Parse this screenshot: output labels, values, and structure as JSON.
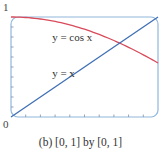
{
  "chart_data": {
    "type": "line",
    "title": "",
    "caption": "(b) [0, 1] by [0, 1]",
    "xlabel": "",
    "ylabel": "",
    "xlim": [
      0,
      1
    ],
    "ylim": [
      0,
      1
    ],
    "grid": false,
    "tick_labels": {
      "y_top": "1",
      "origin": "0"
    },
    "x_ticks": 10,
    "y_ticks": 10,
    "series": [
      {
        "name": "y = cos x",
        "color": "#d94a5a",
        "x": [
          0,
          0.1,
          0.2,
          0.3,
          0.4,
          0.5,
          0.6,
          0.7,
          0.8,
          0.9,
          1.0
        ],
        "values": [
          1.0,
          0.995,
          0.98,
          0.955,
          0.921,
          0.878,
          0.825,
          0.765,
          0.697,
          0.622,
          0.54
        ]
      },
      {
        "name": "y = x",
        "color": "#3f6fb5",
        "x": [
          0,
          1
        ],
        "values": [
          0,
          1
        ]
      }
    ],
    "annotations": [
      {
        "text": "y = cos x",
        "x": 0.28,
        "y": 0.76
      },
      {
        "text": "y = x",
        "x": 0.28,
        "y": 0.4
      }
    ],
    "frame_color": "#8fb8dc"
  }
}
